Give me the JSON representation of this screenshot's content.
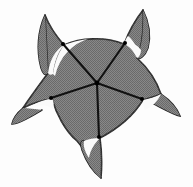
{
  "figure": {
    "canvas": {
      "width": 193,
      "height": 187,
      "background": "#fdfdfd"
    },
    "colors": {
      "background": "#fdfdfd",
      "body_fill": "#7b7b7b",
      "body_dither_light": "#9a9a9a",
      "body_dither_dark": "#5e5e5e",
      "outline": "#1c1c1c",
      "radial_line": "#111111",
      "highlight": "#fafafa",
      "node": "#000000"
    },
    "geometry": {
      "center": {
        "x": 97,
        "y": 83
      },
      "symmetry": "5-fold radial",
      "spike_count": 5,
      "radial_line_count": 5
    },
    "spikes": [
      {
        "name": "spike-top-left",
        "tip": {
          "x": 45,
          "y": 15
        },
        "highlight_label": "crescent-top-left"
      },
      {
        "name": "spike-top-right",
        "tip": {
          "x": 143,
          "y": 10
        },
        "highlight_label": "crescent-top-right"
      },
      {
        "name": "spike-right",
        "tip": {
          "x": 176,
          "y": 112
        },
        "highlight_label": "crescent-right"
      },
      {
        "name": "spike-bottom",
        "tip": {
          "x": 101,
          "y": 178
        },
        "highlight_label": "crescent-bottom"
      },
      {
        "name": "spike-left",
        "tip": {
          "x": 22,
          "y": 118
        },
        "highlight_label": "crescent-left"
      }
    ],
    "radial_lines": [
      {
        "name": "radial-line-upper-left",
        "from": {
          "x": 97,
          "y": 83
        },
        "to": {
          "x": 63,
          "y": 44
        }
      },
      {
        "name": "radial-line-upper-right",
        "from": {
          "x": 97,
          "y": 83
        },
        "to": {
          "x": 125,
          "y": 43
        }
      },
      {
        "name": "radial-line-right",
        "from": {
          "x": 97,
          "y": 83
        },
        "to": {
          "x": 142,
          "y": 99
        }
      },
      {
        "name": "radial-line-bottom",
        "from": {
          "x": 97,
          "y": 83
        },
        "to": {
          "x": 99,
          "y": 137
        }
      },
      {
        "name": "radial-line-left",
        "from": {
          "x": 97,
          "y": 83
        },
        "to": {
          "x": 51,
          "y": 98
        }
      }
    ],
    "nodes": [
      {
        "name": "node-center",
        "x": 97,
        "y": 83
      },
      {
        "name": "node-upper-left",
        "x": 63,
        "y": 44
      },
      {
        "name": "node-upper-right",
        "x": 125,
        "y": 43
      },
      {
        "name": "node-right",
        "x": 142,
        "y": 99
      },
      {
        "name": "node-bottom",
        "x": 99,
        "y": 137
      },
      {
        "name": "node-left",
        "x": 51,
        "y": 98
      }
    ],
    "body_outline_path": "M 45 15 C 52 26 58 34 63 44 C 77 38 101 36 125 43 C 130 31 136 19 143 10 C 143 26 141 41 137 55 C 148 66 156 79 160 93 C 160 93 151 96 142 99 C 135 110 124 124 99 137 C 101 149 101 164 101 178 C 93 163 85 150 76 140 C 64 130 55 113 51 98 C 42 99 32 102 23 107 C 31 96 40 85 48 73 C 48 57 47 35 45 15 Z",
    "spike_paths": [
      {
        "name": "spike-path-top-left",
        "d": "M 45 15 C 41 33 43 56 48 73 C 44 58 48 34 45 15 Z M 45 15 C 52 26 58 34 63 44 C 56 35 50 25 45 15 Z"
      },
      {
        "name": "spike-path-top-right",
        "d": "M 143 10 C 140 27 139 43 137 55 C 139 40 141 24 143 10 Z"
      },
      {
        "name": "spike-path-right",
        "d": "M 176 112 C 166 103 161 97 160 93 C 166 99 172 106 176 112 Z"
      },
      {
        "name": "spike-path-bottom",
        "d": "M 101 178 C 101 164 101 149 99 137 C 100 150 101 164 101 178 Z"
      },
      {
        "name": "spike-path-left",
        "d": "M 22 118 C 22 113 22 110 23 107 C 22 111 22 115 22 118 Z"
      }
    ],
    "highlights": [
      {
        "name": "crescent-top-left",
        "cx": 60,
        "cy": 40,
        "rx": 14,
        "ry": 12,
        "rot": -38
      },
      {
        "name": "crescent-top-right",
        "cx": 132,
        "cy": 36,
        "rx": 10,
        "ry": 14,
        "rot": 12
      },
      {
        "name": "crescent-right",
        "cx": 152,
        "cy": 104,
        "rx": 13,
        "ry": 10,
        "rot": 25
      },
      {
        "name": "crescent-bottom",
        "cx": 92,
        "cy": 142,
        "rx": 10,
        "ry": 12,
        "rot": -16
      },
      {
        "name": "crescent-left",
        "cx": 44,
        "cy": 102,
        "rx": 13,
        "ry": 9,
        "rot": -20
      }
    ]
  }
}
